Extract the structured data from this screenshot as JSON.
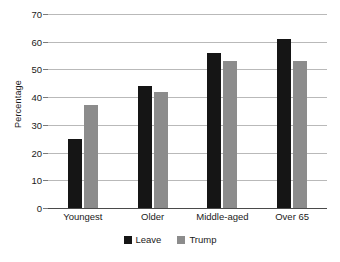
{
  "chart_data": {
    "type": "bar",
    "title": "",
    "xlabel": "",
    "ylabel": "Percentage",
    "ylim": [
      0,
      70
    ],
    "ytick_step": 10,
    "yticks": [
      70,
      60,
      50,
      40,
      30,
      20,
      10,
      0
    ],
    "grid": true,
    "legend_position": "bottom-center",
    "categories": [
      "Youngest",
      "Older",
      "Middle-aged",
      "Over 65"
    ],
    "series": [
      {
        "name": "Leave",
        "color": "#151515",
        "values": [
          25,
          44,
          56,
          61
        ]
      },
      {
        "name": "Trump",
        "color": "#8c8c8c",
        "values": [
          37,
          42,
          53,
          53
        ]
      }
    ]
  },
  "style": {
    "gridline_color": "#b9b9b9",
    "axis_color": "#4a4a4a",
    "background": "#ffffff",
    "text_color": "#1a1a1a"
  }
}
